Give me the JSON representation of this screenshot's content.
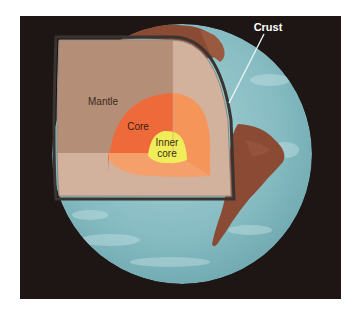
{
  "diagram": {
    "labels": {
      "crust": "Crust",
      "mantle": "Mantle",
      "core": "Core",
      "inner_core_line1": "Inner",
      "inner_core_line2": "core"
    }
  },
  "colors": {
    "background": "#ffffff",
    "space": "#1e1614",
    "ocean": "#7fb6bd",
    "ocean_light": "#a6d0d4",
    "land": "#8a4a34",
    "mantle_dark": "#b58e77",
    "mantle_light": "#d2b29c",
    "core_dark": "#ef6a3a",
    "core_light": "#f5955a",
    "inner_core": "#f0ec5a",
    "crust_outline": "#3a3430",
    "label_dark": "#3a2a22",
    "label_light": "#ffffff"
  }
}
